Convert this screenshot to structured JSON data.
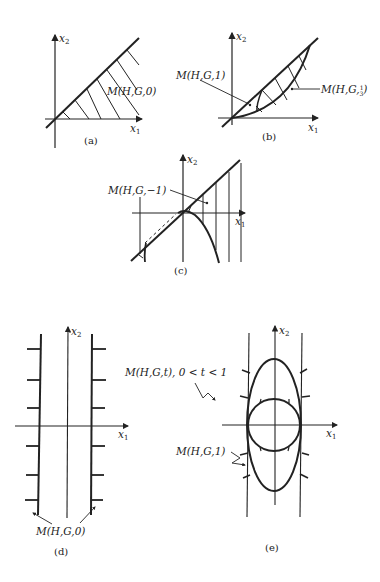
{
  "figure": {
    "panels": [
      {
        "id": "a",
        "caption": "(a)",
        "axis_x": "x",
        "axis_x_sub": "1",
        "axis_y": "x",
        "axis_y_sub": "2",
        "labels": [
          "M(H,G,0)"
        ]
      },
      {
        "id": "b",
        "caption": "(b)",
        "axis_x": "x",
        "axis_x_sub": "1",
        "axis_y": "x",
        "axis_y_sub": "2",
        "labels": [
          "M(H,G,1)",
          "M(H,G,",
          "1",
          "3",
          ")"
        ]
      },
      {
        "id": "c",
        "caption": "(c)",
        "axis_x": "x",
        "axis_x_sub": "1",
        "axis_y": "x",
        "axis_y_sub": "2",
        "labels": [
          "M(H,G,−1)"
        ]
      },
      {
        "id": "d",
        "caption": "(d)",
        "axis_x": "x",
        "axis_x_sub": "1",
        "axis_y": "x",
        "axis_y_sub": "2",
        "labels": [
          "M(H,G,0)"
        ]
      },
      {
        "id": "e",
        "caption": "(e)",
        "axis_x": "x",
        "axis_x_sub": "1",
        "axis_y": "x",
        "axis_y_sub": "2",
        "labels": [
          "M(H,G,t), 0 < t < 1",
          "M(H,G,1)"
        ]
      }
    ]
  }
}
